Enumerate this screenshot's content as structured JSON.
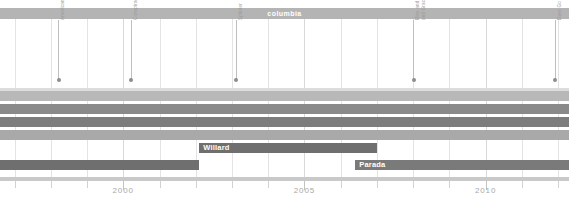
{
  "chart_data": {
    "type": "bar",
    "title": "columbia",
    "xlabel": "",
    "ylabel": "",
    "orientation": "horizontal",
    "xlim": [
      1996.6,
      2012.3
    ],
    "grid": true,
    "legend": "none",
    "tick_labels": [
      "2000",
      "2005",
      "2010"
    ],
    "tick_values": [
      2000,
      2005,
      2010
    ],
    "minor_tick_values": [
      1997,
      1998,
      1999,
      2001,
      2002,
      2003,
      2004,
      2006,
      2007,
      2008,
      2009,
      2011,
      2012
    ],
    "series": [
      {
        "name": "",
        "start": 1996.6,
        "end": 2012.3,
        "row": 0,
        "color": "#b8b8b8",
        "label": ""
      },
      {
        "name": "",
        "start": 1996.6,
        "end": 2012.3,
        "row": 1,
        "color": "#8a8a8a",
        "label": ""
      },
      {
        "name": "",
        "start": 1996.6,
        "end": 2012.3,
        "row": 2,
        "color": "#7d7d7d",
        "label": ""
      },
      {
        "name": "",
        "start": 1996.6,
        "end": 2012.3,
        "row": 3,
        "color": "#a9a9a9",
        "label": ""
      },
      {
        "name": "Willard",
        "start": 2002.1,
        "end": 2007.0,
        "row": 4,
        "color": "#6f6f6f",
        "label": "Willard"
      },
      {
        "name": "Parada",
        "start": 2006.4,
        "end": 2012.3,
        "row": 5,
        "color": "#7a7a7a",
        "label": "Parada"
      },
      {
        "name": "",
        "start": 1996.6,
        "end": 2002.1,
        "row": 5,
        "color": "#6f6f6f",
        "label": ""
      }
    ],
    "events": [
      {
        "label": "Americana",
        "value": 1998.2,
        "lines": [
          "Americana"
        ]
      },
      {
        "label": "Conspiracy of One",
        "value": 2000.2,
        "lines": [
          "Conspiracy of One"
        ]
      },
      {
        "label": "Splinter",
        "value": 2003.1,
        "lines": [
          "Splinter"
        ]
      },
      {
        "label": "Rise and Fall, Rage and Grace",
        "value": 2008.0,
        "lines": [
          "Rise and Fall, Rage",
          "and Grace"
        ]
      },
      {
        "label": "Days Go By",
        "value": 2011.9,
        "lines": [
          "Days Go By"
        ]
      }
    ],
    "colors": {
      "group_band": "#b4b4b4",
      "grid": "#e3e3e3",
      "axis_text": "#a8a8a8",
      "event_text": "#9a9a9a",
      "event_dot": "#8d8d8d",
      "bar_label_text": "#ffffff"
    }
  }
}
